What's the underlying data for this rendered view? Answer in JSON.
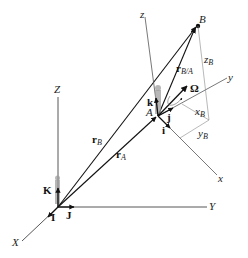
{
  "diagram": {
    "type": "rotating-reference-frame",
    "colors": {
      "background": "#ffffff",
      "line": "#222222",
      "thin_line": "#666666",
      "figure": "#888888"
    },
    "fixed_frame": {
      "axes": {
        "X": "X",
        "Y": "Y",
        "Z": "Z"
      },
      "unit_vectors": {
        "I": "I",
        "J": "J",
        "K": "K"
      }
    },
    "moving_frame": {
      "axes": {
        "x": "x",
        "y": "y",
        "z": "z"
      },
      "unit_vectors": {
        "i": "i",
        "j": "j",
        "k": "k"
      },
      "origin_label": "A",
      "angular_velocity": "Ω"
    },
    "point_B": "B",
    "vectors": {
      "r_A": {
        "main": "r",
        "sub": "A"
      },
      "r_B": {
        "main": "r",
        "sub": "B"
      },
      "r_BA": {
        "main": "r",
        "sub": "B/A"
      }
    },
    "components": {
      "x_B": {
        "main": "x",
        "sub": "B"
      },
      "y_B": {
        "main": "y",
        "sub": "B"
      },
      "z_B": {
        "main": "z",
        "sub": "B"
      }
    }
  }
}
